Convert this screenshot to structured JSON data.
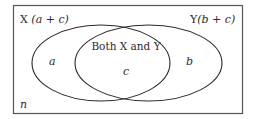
{
  "diagram": {
    "type": "venn",
    "universe_label": "n",
    "sets": [
      {
        "name": "X",
        "label_prefix": "X",
        "label_formula": "(a + c)",
        "region_only_label": "a"
      },
      {
        "name": "Y",
        "label_prefix": "Y",
        "label_formula": "(b + c)",
        "region_only_label": "b"
      }
    ],
    "intersection": {
      "title": "Both X and Y",
      "label": "c"
    },
    "colors": {
      "stroke": "#2a2a2a",
      "background": "#ffffff",
      "text": "#2a2a2a"
    }
  }
}
